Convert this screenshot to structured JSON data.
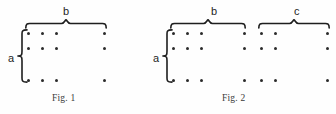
{
  "image": {
    "width": 336,
    "height": 114,
    "background_color": "#fefefe",
    "ink_color": "#1e1e1e",
    "dot_color": "#2b2b2b"
  },
  "figures": [
    {
      "id": "fig-1",
      "caption": "Fig. 1",
      "caption_x": 52,
      "caption_y": 94,
      "row_label": "a",
      "row_label_x": 8,
      "row_label_y": 53,
      "left_brace": {
        "x": 17,
        "y": 29,
        "height": 54
      },
      "column_braces": [
        {
          "label": "b",
          "label_x": 63,
          "label_y": 6,
          "x": 25,
          "y": 19,
          "width": 82
        }
      ],
      "dot_rows_y": [
        32,
        47,
        79
      ],
      "dot_columns_x": [
        27,
        41,
        55,
        103
      ],
      "dots": [
        {
          "x": 27,
          "y": 32
        },
        {
          "x": 41,
          "y": 32
        },
        {
          "x": 55,
          "y": 32
        },
        {
          "x": 103,
          "y": 32
        },
        {
          "x": 27,
          "y": 47
        },
        {
          "x": 41,
          "y": 47
        },
        {
          "x": 55,
          "y": 47
        },
        {
          "x": 103,
          "y": 47
        },
        {
          "x": 27,
          "y": 79
        },
        {
          "x": 41,
          "y": 79
        },
        {
          "x": 55,
          "y": 79
        },
        {
          "x": 103,
          "y": 79
        }
      ]
    },
    {
      "id": "fig-2",
      "caption": "Fig. 2",
      "caption_x": 222,
      "caption_y": 94,
      "row_label": "a",
      "row_label_x": 153,
      "row_label_y": 53,
      "left_brace": {
        "x": 162,
        "y": 29,
        "height": 54
      },
      "column_braces": [
        {
          "label": "b",
          "label_x": 211,
          "label_y": 6,
          "x": 170,
          "y": 19,
          "width": 76
        },
        {
          "label": "c",
          "label_x": 294,
          "label_y": 6,
          "x": 258,
          "y": 19,
          "width": 72
        }
      ],
      "dot_rows_y": [
        32,
        47,
        79
      ],
      "dot_columns_x": [
        172,
        186,
        200,
        243,
        260,
        274,
        326
      ],
      "dots": [
        {
          "x": 172,
          "y": 32
        },
        {
          "x": 186,
          "y": 32
        },
        {
          "x": 200,
          "y": 32
        },
        {
          "x": 243,
          "y": 32
        },
        {
          "x": 260,
          "y": 32
        },
        {
          "x": 274,
          "y": 32
        },
        {
          "x": 326,
          "y": 32
        },
        {
          "x": 172,
          "y": 47
        },
        {
          "x": 186,
          "y": 47
        },
        {
          "x": 200,
          "y": 47
        },
        {
          "x": 243,
          "y": 47
        },
        {
          "x": 260,
          "y": 47
        },
        {
          "x": 274,
          "y": 47
        },
        {
          "x": 326,
          "y": 47
        },
        {
          "x": 172,
          "y": 79
        },
        {
          "x": 186,
          "y": 79
        },
        {
          "x": 200,
          "y": 79
        },
        {
          "x": 243,
          "y": 79
        },
        {
          "x": 260,
          "y": 79
        },
        {
          "x": 274,
          "y": 79
        },
        {
          "x": 326,
          "y": 79
        }
      ]
    }
  ]
}
